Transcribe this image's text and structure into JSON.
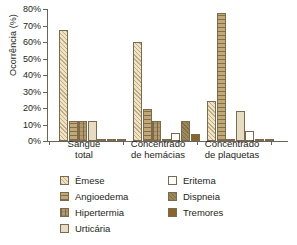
{
  "chart_data": {
    "type": "bar",
    "title": "",
    "xlabel": "",
    "ylabel": "Ocorrência (%)",
    "ylim": [
      0,
      80
    ],
    "ytick_labels": [
      "0%",
      "10%",
      "20%",
      "30%",
      "40%",
      "50%",
      "60%",
      "70%",
      "80%"
    ],
    "ytick_values": [
      0,
      10,
      20,
      30,
      40,
      50,
      60,
      70,
      80
    ],
    "grid": false,
    "legend_position": "bottom",
    "categories": [
      "Sangue\ntotal",
      "Concentrado\nde hemácias",
      "Concentrado\nde plaquetas"
    ],
    "series": [
      {
        "name": "Êmese",
        "color": "#efe3c4",
        "pattern": "diagonal-hatch",
        "values": [
          67.5,
          60.0,
          24.5
        ]
      },
      {
        "name": "Angioedema",
        "color": "#c2a875",
        "pattern": "horizontal-lines",
        "values": [
          12.0,
          19.2,
          77.5
        ]
      },
      {
        "name": "Hipertermia",
        "color": "#b49a6b",
        "pattern": "cross-hatch",
        "values": [
          12.0,
          12.0,
          1.2
        ]
      },
      {
        "name": "Urticária",
        "color": "#e6dcc2",
        "pattern": "solid-light",
        "values": [
          12.0,
          1.2,
          18.3
        ]
      },
      {
        "name": "Eritema",
        "color": "#ffffff",
        "pattern": "solid-white",
        "values": [
          1.2,
          5.0,
          6.3
        ]
      },
      {
        "name": "Dispneia",
        "color": "#9d8757",
        "pattern": "solid-mid",
        "values": [
          1.2,
          12.0,
          1.2
        ]
      },
      {
        "name": "Tremores",
        "color": "#8a6526",
        "pattern": "solid-dark",
        "values": [
          1.2,
          4.3,
          1.2
        ]
      }
    ]
  },
  "legend": {
    "items": [
      {
        "label": "Êmese",
        "swatch": "swatch-emese"
      },
      {
        "label": "Eritema",
        "swatch": "swatch-eritema"
      },
      {
        "label": "Angioedema",
        "swatch": "swatch-angioedema"
      },
      {
        "label": "Dispneia",
        "swatch": "swatch-dispneia"
      },
      {
        "label": "Hipertermia",
        "swatch": "swatch-hipertermia"
      },
      {
        "label": "Tremores",
        "swatch": "swatch-tremores"
      },
      {
        "label": "Urticária",
        "swatch": "swatch-urticaria"
      }
    ]
  }
}
